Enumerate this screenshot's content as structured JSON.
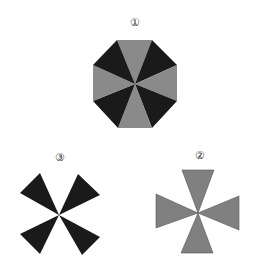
{
  "figures": [
    {
      "id": "figure-1",
      "label": "①",
      "shape": "octagon divided into 8 alternating dark and light triangles",
      "dark_color": "#1a1a1a",
      "light_color": "#8a8a8a"
    },
    {
      "id": "figure-2",
      "label": "②",
      "shape": "four light grey triangles meeting at a center point (plus orientation)",
      "color": "#808080"
    },
    {
      "id": "figure-3",
      "label": "③",
      "shape": "four dark triangles meeting at a center point (X orientation)",
      "color": "#1a1a1a"
    }
  ],
  "colors": {
    "dark": "#1a1a1a",
    "light": "#8a8a8a",
    "mid": "#808080",
    "background": "#ffffff"
  }
}
